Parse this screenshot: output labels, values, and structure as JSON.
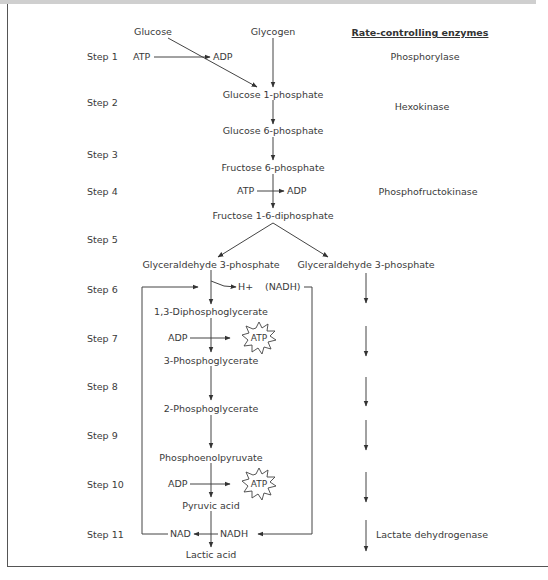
{
  "header": {
    "enzymes_title": "Rate-controlling enzymes"
  },
  "steps": [
    "Step 1",
    "Step 2",
    "Step 3",
    "Step 4",
    "Step 5",
    "Step 6",
    "Step 7",
    "Step 8",
    "Step 9",
    "Step 10",
    "Step 11"
  ],
  "substrates": {
    "glucose": "Glucose",
    "glycogen": "Glycogen",
    "glucose_1p": "Glucose 1-phosphate",
    "glucose_6p": "Glucose 6-phosphate",
    "fructose_6p": "Fructose 6-phosphate",
    "fructose_16dp": "Fructose 1-6-diphosphate",
    "g3p_left": "Glyceraldehyde 3-phosphate",
    "g3p_right": "Glyceraldehyde 3-phosphate",
    "dpg13": "1,3-Diphosphoglycerate",
    "pg3": "3-Phosphoglycerate",
    "pg2": "2-Phosphoglycerate",
    "pep": "Phosphoenolpyruvate",
    "pyruvic": "Pyruvic acid",
    "lactic": "Lactic acid"
  },
  "cofactors": {
    "step1_atp": "ATP",
    "step1_adp": "ADP",
    "step4_atp": "ATP",
    "step4_adp": "ADP",
    "step6_h": "H+",
    "step6_nadh": "(NADH)",
    "step7_adp": "ADP",
    "step7_atp": "ATP",
    "step10_adp": "ADP",
    "step10_atp": "ATP",
    "step11_nad": "NAD",
    "step11_nadh": "NADH"
  },
  "enzymes": {
    "phosphorylase": "Phosphorylase",
    "hexokinase": "Hexokinase",
    "phosphofructokinase": "Phosphofructokinase",
    "lactate_dehydrogenase": "Lactate dehydrogenase"
  }
}
